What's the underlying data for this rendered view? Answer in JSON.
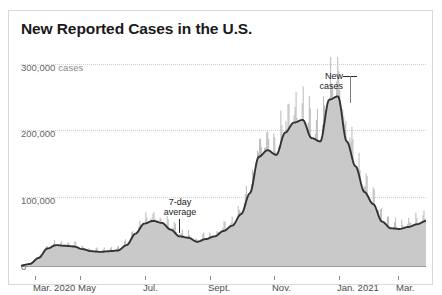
{
  "chart": {
    "title": "New Reported Cases in the U.S.",
    "y_axis": {
      "top_label_value": "300,000",
      "top_label_unit": "cases",
      "labels": [
        "300,000",
        "200,000",
        "100,000",
        "0"
      ]
    },
    "x_axis": {
      "labels": [
        "Mar. 2020",
        "May",
        "Jul.",
        "Sept.",
        "Nov.",
        "Jan. 2021",
        "Mar."
      ]
    },
    "annotations": [
      {
        "id": "seven-day",
        "line1": "7-day",
        "line2": "average"
      },
      {
        "id": "new-cases",
        "line1": "New",
        "line2": "cases"
      }
    ],
    "colors": {
      "area_fill": "#c9c9c9",
      "bars": "#b3b3b3",
      "average_line": "#333333",
      "gridline": "#cfcfcf",
      "axis": "#9a9a9a",
      "title": "#1a1a1a",
      "label": "#666666",
      "border": "#d8d8d8"
    }
  },
  "chart_data": {
    "type": "area",
    "title": "New Reported Cases in the U.S.",
    "xlabel": "",
    "ylabel": "cases",
    "ylim": [
      0,
      300000
    ],
    "grid": true,
    "legend": "annotation",
    "x_tick_labels": [
      "Mar. 2020",
      "May",
      "Jul.",
      "Sept.",
      "Nov.",
      "Jan. 2021",
      "Mar."
    ],
    "x_tick_fractions": [
      0.035,
      0.145,
      0.305,
      0.465,
      0.625,
      0.785,
      0.93
    ],
    "y_ticks": [
      0,
      100000,
      200000,
      300000
    ],
    "series": [
      {
        "name": "7-day average",
        "type": "line",
        "color": "#333333",
        "x": [
          "2020-03-01",
          "2020-03-15",
          "2020-03-25",
          "2020-04-01",
          "2020-04-08",
          "2020-04-15",
          "2020-04-25",
          "2020-05-05",
          "2020-05-15",
          "2020-05-25",
          "2020-06-05",
          "2020-06-15",
          "2020-06-25",
          "2020-07-05",
          "2020-07-15",
          "2020-07-22",
          "2020-07-30",
          "2020-08-10",
          "2020-08-20",
          "2020-09-01",
          "2020-09-10",
          "2020-09-20",
          "2020-10-01",
          "2020-10-10",
          "2020-10-20",
          "2020-10-30",
          "2020-11-08",
          "2020-11-15",
          "2020-11-22",
          "2020-11-28",
          "2020-12-05",
          "2020-12-12",
          "2020-12-18",
          "2020-12-25",
          "2021-01-01",
          "2021-01-08",
          "2021-01-12",
          "2021-01-20",
          "2021-01-28",
          "2021-02-05",
          "2021-02-12",
          "2021-02-20",
          "2021-03-01",
          "2021-03-10",
          "2021-03-20",
          "2021-03-28",
          "2021-04-05"
        ],
        "values": [
          500,
          3000,
          12000,
          26000,
          31000,
          30000,
          29000,
          25000,
          22000,
          21000,
          22000,
          23000,
          31000,
          48000,
          63000,
          67000,
          64000,
          54000,
          44000,
          42000,
          36000,
          40000,
          44000,
          52000,
          60000,
          77000,
          108000,
          162000,
          172000,
          165000,
          198000,
          213000,
          217000,
          190000,
          185000,
          247000,
          252000,
          185000,
          148000,
          110000,
          92000,
          66000,
          56000,
          55000,
          58000,
          62000,
          67000
        ]
      },
      {
        "name": "New cases",
        "type": "bar",
        "color": "#b3b3b3",
        "description": "Daily reported new cases, shown as light gray bars behind the 7-day average line; daily values fluctuate roughly ±30% around the average with weekday spikes."
      }
    ],
    "notes": [
      "Peak 7-day average of about 250,000 cases occurred in early-to-mid January 2021.",
      "Spring 2020 plateau around 30,000; summer 2020 peak around 67,000 in late July."
    ]
  }
}
